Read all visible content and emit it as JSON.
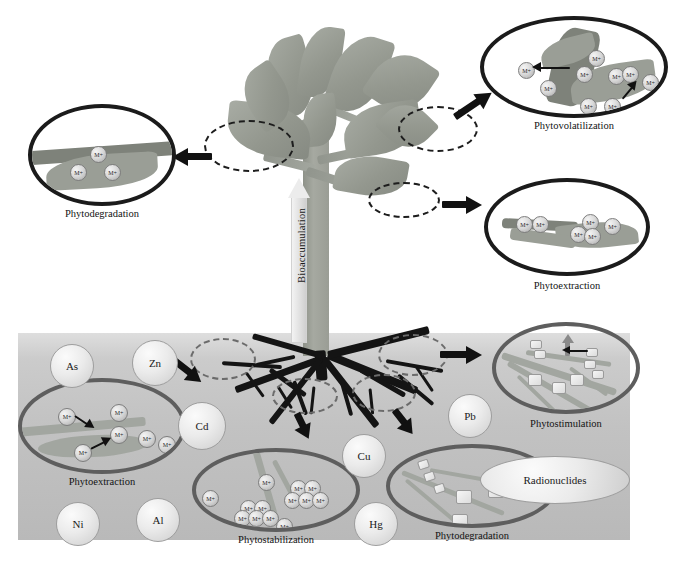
{
  "figure": {
    "bioaccumulation_label": "Bioaccumulation",
    "ion_symbol": "M+"
  },
  "callouts": [
    {
      "id": "phytodegradation-aerial",
      "label": "Phytodegradation",
      "ring": "dark"
    },
    {
      "id": "phytovolatilization",
      "label": "Phytovolatilization",
      "ring": "dark"
    },
    {
      "id": "phytoextraction-aerial",
      "label": "Phytoextraction",
      "ring": "dark"
    },
    {
      "id": "phytostimulation",
      "label": "Phytostimulation",
      "ring": "gray"
    },
    {
      "id": "phytoextraction-root",
      "label": "Phytoextraction",
      "ring": "gray"
    },
    {
      "id": "phytostabilization",
      "label": "Phytostabilization",
      "ring": "gray"
    },
    {
      "id": "phytodegradation-soil",
      "label": "Phytodegradation",
      "ring": "gray"
    }
  ],
  "soil_contaminants": [
    {
      "symbol": "As"
    },
    {
      "symbol": "Zn"
    },
    {
      "symbol": "Cd"
    },
    {
      "symbol": "Pb"
    },
    {
      "symbol": "Cu"
    },
    {
      "symbol": "Ni"
    },
    {
      "symbol": "Al"
    },
    {
      "symbol": "Hg"
    },
    {
      "symbol": "Radionuclides"
    }
  ],
  "colors": {
    "foliage": "#9a9e96",
    "soil": "#c6c6c6",
    "ring_dark": "#1b1b1b",
    "ring_gray": "#5e5e5e",
    "root": "#141414",
    "background": "#ffffff"
  }
}
